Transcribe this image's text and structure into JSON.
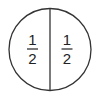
{
  "diagram": {
    "title": "",
    "shape": "circle divided into two equal halves",
    "circle": {
      "cx": 50,
      "cy": 49.5,
      "r": 41,
      "stroke": "#333333"
    },
    "divider": {
      "x": 50,
      "orientation": "vertical"
    },
    "sections": [
      {
        "position": "left",
        "numerator": "1",
        "denominator": "2"
      },
      {
        "position": "right",
        "numerator": "1",
        "denominator": "2"
      }
    ]
  }
}
